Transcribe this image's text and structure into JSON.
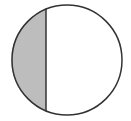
{
  "diagram": {
    "circle": {
      "cx": 67,
      "cy": 60,
      "r": 55
    },
    "chord_x": 46,
    "colors": {
      "stroke": "#333333",
      "shaded": "#bdbdbd",
      "fill": "#ffffff"
    }
  }
}
